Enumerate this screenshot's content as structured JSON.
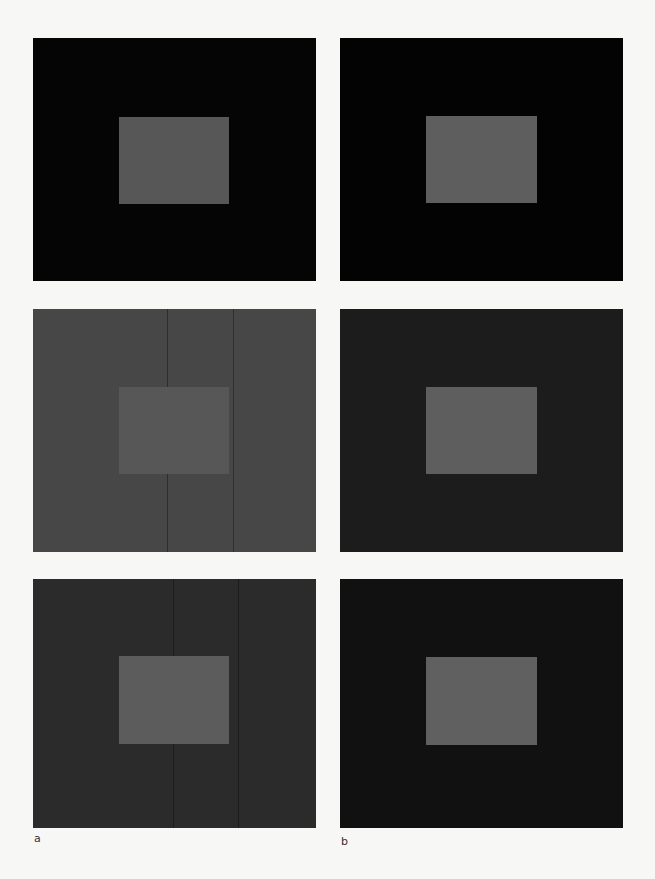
{
  "figure": {
    "columns": [
      {
        "label": "a",
        "panels": [
          {
            "background": "#050505",
            "inner": "#575757"
          },
          {
            "background": "#474747",
            "inner": "#575757"
          },
          {
            "background": "#2b2b2b",
            "inner": "#5c5c5c"
          }
        ]
      },
      {
        "label": "b",
        "panels": [
          {
            "background": "#030303",
            "inner": "#5e5e5e"
          },
          {
            "background": "#1c1c1c",
            "inner": "#5e5e5e"
          },
          {
            "background": "#111111",
            "inner": "#606060"
          }
        ]
      }
    ]
  }
}
